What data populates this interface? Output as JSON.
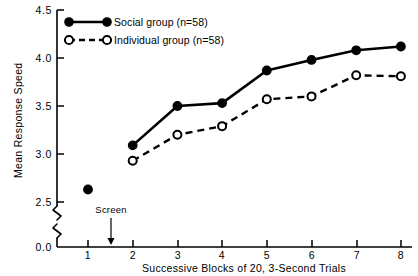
{
  "chart_data": {
    "type": "line",
    "title": "",
    "xlabel": "Successive Blocks of 20, 3-Second Trials",
    "ylabel": "Mean Response Speed",
    "x": [
      1,
      2,
      3,
      4,
      5,
      6,
      7,
      8
    ],
    "xticklabels": [
      "1",
      "2",
      "3",
      "4",
      "5",
      "6",
      "7",
      "8"
    ],
    "yticklabels": [
      "0.0",
      "2.5",
      "3.0",
      "3.5",
      "4.0",
      "4.5"
    ],
    "ytickvalues": [
      0.0,
      2.5,
      3.0,
      3.5,
      4.0,
      4.5
    ],
    "ylim": [
      2.45,
      4.5
    ],
    "xlim": [
      0.6,
      8.4
    ],
    "yaxis_break": true,
    "yaxis_break_between": [
      0.0,
      2.5
    ],
    "grid": false,
    "legend_position": "upper left",
    "series": [
      {
        "name": "Social group (n=58)",
        "marker": "filled-circle",
        "linestyle": "solid",
        "x": [
          1,
          2,
          3,
          4,
          5,
          6,
          7,
          8
        ],
        "values": [
          2.63,
          3.09,
          3.5,
          3.53,
          3.87,
          3.98,
          4.08,
          4.12
        ],
        "line_from_index": 1
      },
      {
        "name": "Individual group (n=58)",
        "marker": "open-circle",
        "linestyle": "dashed",
        "x": [
          2,
          3,
          4,
          5,
          6,
          7,
          8
        ],
        "values": [
          2.93,
          3.2,
          3.29,
          3.57,
          3.6,
          3.82,
          3.81
        ]
      }
    ],
    "annotations": [
      {
        "text": "Screen",
        "x": 1.5,
        "arrow": "down-to-axis"
      }
    ],
    "colors": {
      "line": "#000000",
      "marker_fill_social": "#000000",
      "marker_fill_individual": "#ffffff",
      "axis": "#000000",
      "background": "#ffffff"
    }
  },
  "legend": {
    "entries": [
      {
        "label": "Social group (n=58)"
      },
      {
        "label": "Individual group (n=58)"
      }
    ]
  },
  "axes": {
    "y_title": "Mean Response Speed",
    "x_title": "Successive Blocks of 20, 3-Second Trials",
    "y_ticks": [
      "4.5",
      "4.0",
      "3.5",
      "3.0",
      "2.5",
      "0.0"
    ],
    "x_ticks": [
      "1",
      "2",
      "3",
      "4",
      "5",
      "6",
      "7",
      "8"
    ]
  },
  "annotation": {
    "screen_label": "Screen"
  }
}
